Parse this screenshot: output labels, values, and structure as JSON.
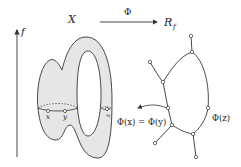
{
  "figure": {
    "axis_label": "f",
    "space_label": "X",
    "map_label": "Φ",
    "graph_label_main": "R",
    "graph_label_sub": "f",
    "point_labels": [
      "x",
      "y",
      "z"
    ],
    "annotation_xy": "Φ(x) = Φ(y)",
    "annotation_z": "Φ(z)"
  },
  "colors": {
    "surface_fill": "#e6e6e6",
    "stroke": "#333333",
    "background": "#ffffff"
  }
}
